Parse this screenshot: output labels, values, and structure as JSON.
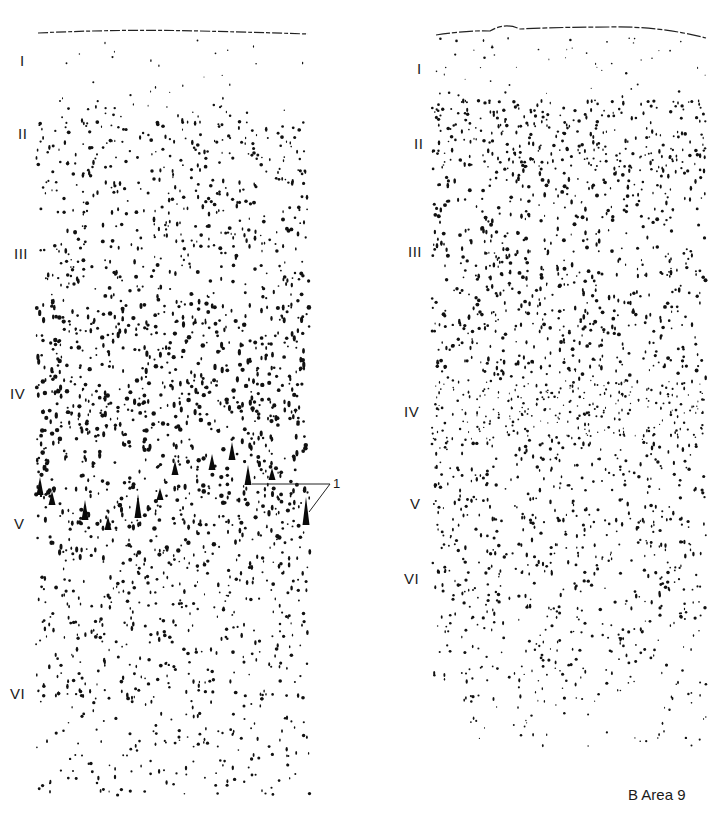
{
  "figure": {
    "caption": "B  Area 9",
    "callout": {
      "label": "1"
    },
    "panels": [
      {
        "id": "left",
        "layers": [
          {
            "label": "I",
            "y": 62
          },
          {
            "label": "II",
            "y": 135
          },
          {
            "label": "III",
            "y": 255
          },
          {
            "label": "IV",
            "y": 395
          },
          {
            "label": "V",
            "y": 525
          },
          {
            "label": "VI",
            "y": 695
          }
        ]
      },
      {
        "id": "right",
        "layers": [
          {
            "label": "I",
            "y": 70
          },
          {
            "label": "II",
            "y": 145
          },
          {
            "label": "III",
            "y": 253
          },
          {
            "label": "IV",
            "y": 413
          },
          {
            "label": "V",
            "y": 505
          },
          {
            "label": "VI",
            "y": 580
          }
        ]
      }
    ]
  }
}
